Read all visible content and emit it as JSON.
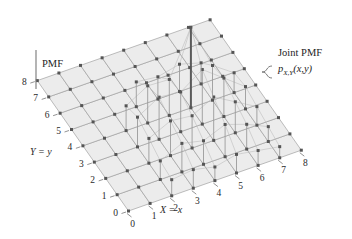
{
  "figure": {
    "background": "#ffffff",
    "grid_fill": "#ececec",
    "grid_stroke": "#9a9a9a",
    "dot_color": "#555555",
    "stem_color": "#9b9b9b",
    "stem_highlight_color": "#5a5a5a",
    "axis_color": "#777777",
    "text_color": "#1d1d1d"
  },
  "labels": {
    "pmf_axis": "PMF",
    "x_axis_title": "X = x",
    "y_axis_title": "Y = y",
    "annotation_line1": "Joint PMF",
    "annotation_p": "p",
    "annotation_sub": "X,Y",
    "annotation_args": "(x,y)"
  },
  "axes": {
    "x_ticks": [
      "0",
      "1",
      "2",
      "3",
      "4",
      "5",
      "6",
      "7",
      "8"
    ],
    "y_ticks": [
      "0",
      "1",
      "2",
      "3",
      "4",
      "5",
      "6",
      "7",
      "8"
    ],
    "x_min": 0,
    "x_max": 8,
    "y_min": 0,
    "y_max": 8
  },
  "chart_data": {
    "type": "scatter",
    "title": "",
    "xlabel": "X = x",
    "ylabel": "Y = y",
    "zlabel": "PMF",
    "xlim": [
      0,
      8
    ],
    "ylim": [
      0,
      8
    ],
    "categories": [
      "0",
      "1",
      "2",
      "3",
      "4",
      "5",
      "6",
      "7",
      "8"
    ],
    "grid": true,
    "legend": "none",
    "annotations": [
      "Joint PMF",
      "p_{X,Y}(x,y)",
      "PMF",
      "X = x",
      "Y = y"
    ],
    "note": "3D stem plot of a joint PMF over integer lattice 0..8 x 0..8; stems of varying height rise above the base plane",
    "stems": [
      {
        "x": 2,
        "y": 0,
        "z": 0.26
      },
      {
        "x": 3,
        "y": 0,
        "z": 0.3
      },
      {
        "x": 4,
        "y": 0,
        "z": 0.22
      },
      {
        "x": 5,
        "y": 0,
        "z": 0.3
      },
      {
        "x": 6,
        "y": 0,
        "z": 0.24
      },
      {
        "x": 7,
        "y": 0,
        "z": 0.18
      },
      {
        "x": 2,
        "y": 1,
        "z": 0.3
      },
      {
        "x": 3,
        "y": 1,
        "z": 0.46
      },
      {
        "x": 4,
        "y": 1,
        "z": 0.38
      },
      {
        "x": 5,
        "y": 1,
        "z": 0.52
      },
      {
        "x": 6,
        "y": 1,
        "z": 0.4
      },
      {
        "x": 7,
        "y": 1,
        "z": 0.24
      },
      {
        "x": 2,
        "y": 2,
        "z": 0.4
      },
      {
        "x": 3,
        "y": 2,
        "z": 0.56
      },
      {
        "x": 4,
        "y": 2,
        "z": 0.52
      },
      {
        "x": 5,
        "y": 2,
        "z": 0.7
      },
      {
        "x": 6,
        "y": 2,
        "z": 0.5
      },
      {
        "x": 7,
        "y": 2,
        "z": 0.3
      },
      {
        "x": 2,
        "y": 3,
        "z": 0.48
      },
      {
        "x": 3,
        "y": 3,
        "z": 0.68
      },
      {
        "x": 4,
        "y": 3,
        "z": 0.64
      },
      {
        "x": 5,
        "y": 3,
        "z": 0.88
      },
      {
        "x": 6,
        "y": 3,
        "z": 0.62
      },
      {
        "x": 7,
        "y": 3,
        "z": 0.36
      },
      {
        "x": 2,
        "y": 4,
        "z": 0.4
      },
      {
        "x": 3,
        "y": 4,
        "z": 0.6
      },
      {
        "x": 4,
        "y": 4,
        "z": 0.58
      },
      {
        "x": 5,
        "y": 4,
        "z": 1.3
      },
      {
        "x": 6,
        "y": 4,
        "z": 0.56
      },
      {
        "x": 7,
        "y": 4,
        "z": 0.32
      },
      {
        "x": 3,
        "y": 5,
        "z": 0.4
      },
      {
        "x": 4,
        "y": 5,
        "z": 0.36
      },
      {
        "x": 5,
        "y": 5,
        "z": 0.44
      },
      {
        "x": 6,
        "y": 5,
        "z": 0.34
      }
    ]
  }
}
